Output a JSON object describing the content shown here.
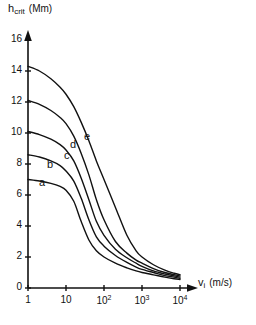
{
  "chart_data": {
    "type": "line",
    "title": "",
    "ylabel": "h_crit (Mm)",
    "ylabel_main": "h",
    "ylabel_sub": "crit",
    "ylabel_unit": "(Mm)",
    "xlabel": "v_i (m/s)",
    "xlabel_main": "v",
    "xlabel_sub": "i",
    "xlabel_unit": "(m/s)",
    "xscale": "log",
    "xlim": [
      1,
      10000
    ],
    "ylim": [
      0,
      16
    ],
    "grid": false,
    "legend": "inline-curve-labels",
    "x_tick_labels": [
      "1",
      "10",
      "10^2",
      "10^3",
      "10^4"
    ],
    "x_tick_values": [
      1,
      10,
      100,
      1000,
      10000
    ],
    "y_tick_labels": [
      "0",
      "2",
      "4",
      "6",
      "8",
      "10",
      "12",
      "14",
      "16"
    ],
    "y_tick_values": [
      0,
      2,
      4,
      6,
      8,
      10,
      12,
      14,
      16
    ],
    "series": [
      {
        "name": "a",
        "label": "a",
        "x": [
          1,
          2,
          4,
          7,
          10,
          16,
          25,
          40,
          63,
          100,
          200,
          400,
          700,
          1000,
          2000,
          4000,
          7000,
          10000
        ],
        "values": [
          7.0,
          6.9,
          6.75,
          6.55,
          6.3,
          5.6,
          4.3,
          3.1,
          2.4,
          2.0,
          1.6,
          1.3,
          1.1,
          1.0,
          0.85,
          0.7,
          0.6,
          0.55
        ]
      },
      {
        "name": "b",
        "label": "b",
        "x": [
          1,
          2,
          4,
          7,
          10,
          16,
          25,
          40,
          63,
          100,
          200,
          400,
          700,
          1000,
          2000,
          4000,
          7000,
          10000
        ],
        "values": [
          8.6,
          8.45,
          8.2,
          7.9,
          7.55,
          6.9,
          5.8,
          4.4,
          3.3,
          2.7,
          2.1,
          1.65,
          1.35,
          1.2,
          1.0,
          0.8,
          0.7,
          0.62
        ]
      },
      {
        "name": "c",
        "label": "c",
        "x": [
          1,
          2,
          4,
          7,
          10,
          16,
          25,
          40,
          63,
          100,
          200,
          400,
          700,
          1000,
          2000,
          4000,
          7000,
          10000
        ],
        "values": [
          10.1,
          9.9,
          9.6,
          9.25,
          8.9,
          8.2,
          7.1,
          5.7,
          4.3,
          3.4,
          2.5,
          1.95,
          1.6,
          1.4,
          1.1,
          0.9,
          0.78,
          0.7
        ]
      },
      {
        "name": "d",
        "label": "d",
        "x": [
          1,
          2,
          4,
          7,
          10,
          16,
          25,
          40,
          63,
          100,
          200,
          400,
          700,
          1000,
          2000,
          4000,
          7000,
          10000
        ],
        "values": [
          12.1,
          11.85,
          11.45,
          11.0,
          10.6,
          9.8,
          8.7,
          7.3,
          5.7,
          4.4,
          3.0,
          2.25,
          1.8,
          1.6,
          1.25,
          1.0,
          0.86,
          0.78
        ]
      },
      {
        "name": "e",
        "label": "e",
        "x": [
          1,
          2,
          4,
          7,
          10,
          16,
          25,
          40,
          63,
          100,
          200,
          400,
          700,
          1000,
          2000,
          4000,
          7000,
          10000
        ],
        "values": [
          14.3,
          14.0,
          13.5,
          12.95,
          12.5,
          11.7,
          10.7,
          9.5,
          8.2,
          7.0,
          5.2,
          3.4,
          2.4,
          2.0,
          1.5,
          1.15,
          0.95,
          0.86
        ]
      }
    ],
    "curve_labels": [
      {
        "label": "a",
        "x": 39,
        "y": 184
      },
      {
        "label": "b",
        "x": 47,
        "y": 166
      },
      {
        "label": "c",
        "x": 64,
        "y": 157
      },
      {
        "label": "d",
        "x": 70,
        "y": 146
      },
      {
        "label": "e",
        "x": 84,
        "y": 138
      }
    ]
  },
  "axis": {
    "y_title_main": "h",
    "y_title_sub": "crit",
    "y_title_unit": "(Mm)",
    "x_title_main": "v",
    "x_title_sub": "i",
    "x_title_unit": "(m/s)"
  },
  "colors": {
    "ink": "#111111",
    "background": "#ffffff"
  }
}
